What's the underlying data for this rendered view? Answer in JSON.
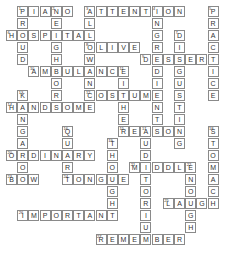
{
  "puzzle": {
    "cell_w": 11.2,
    "cell_h": 12,
    "words": [
      {
        "num": "1",
        "dir": "down",
        "col": 1,
        "row": 0,
        "answer": "PROUD"
      },
      {
        "num": "1",
        "dir": "across",
        "col": 1,
        "row": 0,
        "answer": "PIANO"
      },
      {
        "num": "2",
        "dir": "down",
        "col": 4,
        "row": 0,
        "answer": "NEIGHBORS"
      },
      {
        "num": "3",
        "dir": "across",
        "col": 7,
        "row": 0,
        "answer": "ATTENTION"
      },
      {
        "num": "3",
        "dir": "down",
        "col": 7,
        "row": 0,
        "answer": "ALLOWANCE"
      },
      {
        "num": "4",
        "dir": "down",
        "col": 13,
        "row": 0,
        "answer": "INGREDIENT"
      },
      {
        "num": "5",
        "dir": "down",
        "col": 18,
        "row": 0,
        "answer": "PRACTICE"
      },
      {
        "num": "6",
        "dir": "across",
        "col": 0,
        "row": 2,
        "answer": "HOSPITAL"
      },
      {
        "num": "7",
        "dir": "down",
        "col": 15,
        "row": 2,
        "answer": "DISGUSTING"
      },
      {
        "num": "8",
        "dir": "across",
        "col": 7,
        "row": 3,
        "answer": "OLIVE"
      },
      {
        "num": "9",
        "dir": "across",
        "col": 12,
        "row": 4,
        "answer": "DESSERT"
      },
      {
        "num": "10",
        "dir": "across",
        "col": 2,
        "row": 5,
        "answer": "AMBULANCE"
      },
      {
        "num": "11",
        "dir": "down",
        "col": 10,
        "row": 5,
        "answer": "EITHER"
      },
      {
        "num": "12",
        "dir": "across",
        "col": 7,
        "row": 7,
        "answer": "COSTUME"
      },
      {
        "num": "13",
        "dir": "down",
        "col": 1,
        "row": 7,
        "answer": "KANGAROO"
      },
      {
        "num": "14",
        "dir": "across",
        "col": 0,
        "row": 8,
        "answer": "HANDSOME"
      },
      {
        "num": "15",
        "dir": "across",
        "col": 10,
        "row": 10,
        "answer": "REASON"
      },
      {
        "num": "16",
        "dir": "down",
        "col": 5,
        "row": 10,
        "answer": "QUART"
      },
      {
        "num": "17",
        "dir": "down",
        "col": 12,
        "row": 10,
        "answer": "AUDITORIUM"
      },
      {
        "num": "18",
        "dir": "down",
        "col": 18,
        "row": 10,
        "answer": "STOMACH"
      },
      {
        "num": "19",
        "dir": "down",
        "col": 9,
        "row": 11,
        "answer": "THOUGHT"
      },
      {
        "num": "20",
        "dir": "across",
        "col": 0,
        "row": 12,
        "answer": "ORDINARY"
      },
      {
        "num": "21",
        "dir": "across",
        "col": 11,
        "row": 13,
        "answer": "MIDDLE"
      },
      {
        "num": "22",
        "dir": "down",
        "col": 16,
        "row": 13,
        "answer": "ENOUGH"
      },
      {
        "num": "23",
        "dir": "across",
        "col": 0,
        "row": 14,
        "answer": "BOW"
      },
      {
        "num": "24",
        "dir": "across",
        "col": 5,
        "row": 14,
        "answer": "TONGUE"
      },
      {
        "num": "25",
        "dir": "across",
        "col": 14,
        "row": 16,
        "answer": "LAUGH"
      },
      {
        "num": "26",
        "dir": "across",
        "col": 1,
        "row": 17,
        "answer": "IMPORTANT"
      },
      {
        "num": "27",
        "dir": "across",
        "col": 8,
        "row": 19,
        "answer": "REMEMBER"
      }
    ]
  }
}
